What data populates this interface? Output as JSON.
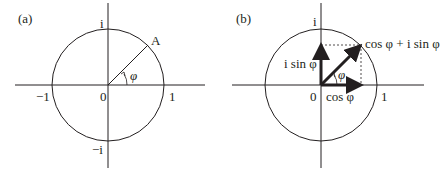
{
  "panel_a": {
    "tag": "(a)",
    "axis_top": "i",
    "axis_bottom": "−i",
    "axis_left": "−1",
    "axis_right": "1",
    "origin": "0",
    "point": "A",
    "angle": "φ"
  },
  "panel_b": {
    "tag": "(b)",
    "axis_top": "i",
    "axis_right": "1",
    "origin": "0",
    "angle": "φ",
    "vertical_vector": "i sin φ",
    "horizontal_vector": "cos φ",
    "sum_vector": "cos φ + i sin φ"
  },
  "colors": {
    "line": "#231f20",
    "background": "#ffffff"
  }
}
